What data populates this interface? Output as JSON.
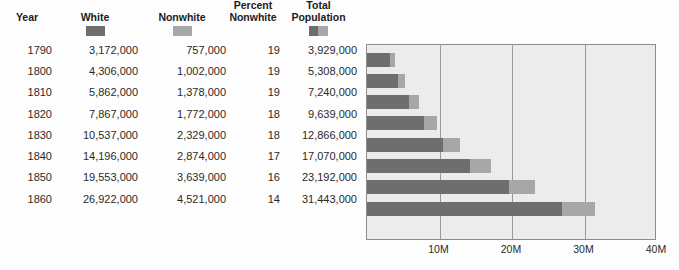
{
  "table": {
    "columns": [
      {
        "key": "year",
        "label": "Year",
        "swatch": null
      },
      {
        "key": "white",
        "label": "White",
        "swatch": "white-swatch"
      },
      {
        "key": "nonwhite",
        "label": "Nonwhite",
        "swatch": "nonwhite-swatch"
      },
      {
        "key": "percent_nonwhite",
        "label": "Percent\nNonwhite",
        "label_line1": "Percent",
        "label_line2": "Nonwhite",
        "swatch": null
      },
      {
        "key": "total",
        "label": "Total\nPopulation",
        "label_line1": "Total",
        "label_line2": "Population",
        "swatch": "total-swatch"
      }
    ],
    "rows": [
      {
        "year": "1790",
        "white": "3,172,000",
        "nonwhite": "757,000",
        "percent_nonwhite": "19",
        "total": "3,929,000"
      },
      {
        "year": "1800",
        "white": "4,306,000",
        "nonwhite": "1,002,000",
        "percent_nonwhite": "19",
        "total": "5,308,000"
      },
      {
        "year": "1810",
        "white": "5,862,000",
        "nonwhite": "1,378,000",
        "percent_nonwhite": "19",
        "total": "7,240,000"
      },
      {
        "year": "1820",
        "white": "7,867,000",
        "nonwhite": "1,772,000",
        "percent_nonwhite": "18",
        "total": "9,639,000"
      },
      {
        "year": "1830",
        "white": "10,537,000",
        "nonwhite": "2,329,000",
        "percent_nonwhite": "18",
        "total": "12,866,000"
      },
      {
        "year": "1840",
        "white": "14,196,000",
        "nonwhite": "2,874,000",
        "percent_nonwhite": "17",
        "total": "17,070,000"
      },
      {
        "year": "1850",
        "white": "19,553,000",
        "nonwhite": "3,639,000",
        "percent_nonwhite": "16",
        "total": "23,192,000"
      },
      {
        "year": "1860",
        "white": "26,922,000",
        "nonwhite": "4,521,000",
        "percent_nonwhite": "14",
        "total": "31,443,000"
      }
    ]
  },
  "colors": {
    "white_series": "#6e6e6e",
    "nonwhite_series": "#a7a7a7",
    "plot_background": "#ececec",
    "plot_border": "#8d8d8d",
    "gridline": "#9a9a9a",
    "page_background": "#fdfdfd",
    "text": "#2a2a2a"
  },
  "chart_data": {
    "type": "bar",
    "orientation": "horizontal",
    "stacked": true,
    "title": "",
    "xlabel": "",
    "ylabel": "",
    "categories": [
      "1790",
      "1800",
      "1810",
      "1820",
      "1830",
      "1840",
      "1850",
      "1860"
    ],
    "series": [
      {
        "name": "White",
        "color": "#6e6e6e",
        "values": [
          3172000,
          4306000,
          5862000,
          7867000,
          10537000,
          14196000,
          19553000,
          26922000
        ]
      },
      {
        "name": "Nonwhite",
        "color": "#a7a7a7",
        "values": [
          757000,
          1002000,
          1378000,
          1772000,
          2329000,
          2874000,
          3639000,
          4521000
        ]
      }
    ],
    "totals": [
      3929000,
      5308000,
      7240000,
      9639000,
      12866000,
      17070000,
      23192000,
      31443000
    ],
    "xlim": [
      0,
      40000000
    ],
    "xticks": [
      10000000,
      20000000,
      30000000,
      40000000
    ],
    "xticklabels": [
      "10M",
      "20M",
      "30M",
      "40M"
    ],
    "grid": true,
    "grid_axis": "x",
    "legend": "in-table-header"
  }
}
